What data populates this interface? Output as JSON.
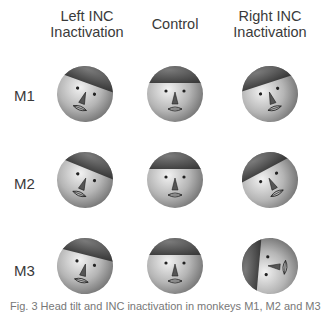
{
  "figure": {
    "columns": [
      {
        "line1": "Left INC",
        "line2": "Inactivation"
      },
      {
        "line1": "Control",
        "line2": ""
      },
      {
        "line1": "Right INC",
        "line2": "Inactivation"
      }
    ],
    "rows": [
      "M1",
      "M2",
      "M3"
    ],
    "caption_partial": "Fig. 3  Head tilt and INC inactivation in monkeys M1, M2 and M3"
  },
  "faces": [
    [
      {
        "tilt": 20,
        "roll": 0
      },
      {
        "tilt": 0,
        "roll": 0
      },
      {
        "tilt": -18,
        "roll": 0
      }
    ],
    [
      {
        "tilt": 22,
        "roll": 0
      },
      {
        "tilt": 0,
        "roll": 0
      },
      {
        "tilt": -28,
        "roll": 0
      }
    ],
    [
      {
        "tilt": 14,
        "roll": 0
      },
      {
        "tilt": 0,
        "roll": 0
      },
      {
        "tilt": -85,
        "roll": 0
      }
    ]
  ]
}
